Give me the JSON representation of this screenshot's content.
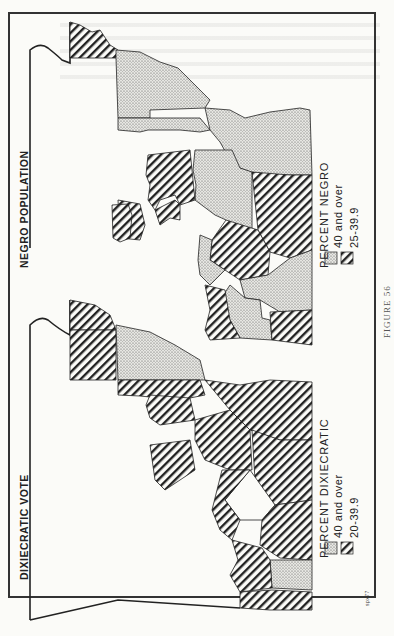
{
  "figure": {
    "caption": "FIGURE 56",
    "credit_mark": "spx77"
  },
  "maps": [
    {
      "id": "negro-population",
      "title": "NEGRO POPULATION",
      "legend": {
        "title": "PERCENT NEGRO",
        "items": [
          {
            "label": "40 and over",
            "pattern": "stipple"
          },
          {
            "label": "25-39.9",
            "pattern": "hatch"
          }
        ]
      }
    },
    {
      "id": "dixiecratic-vote",
      "title": "DIXIECRATIC VOTE",
      "legend": {
        "title": "PERCENT DIXIECRATIC",
        "items": [
          {
            "label": "40 and over",
            "pattern": "stipple"
          },
          {
            "label": "20-39.9",
            "pattern": "hatch"
          }
        ]
      }
    }
  ],
  "colors": {
    "ink": "#222222",
    "paper": "#fbfbf8",
    "stipple": "#cfcfcf"
  }
}
